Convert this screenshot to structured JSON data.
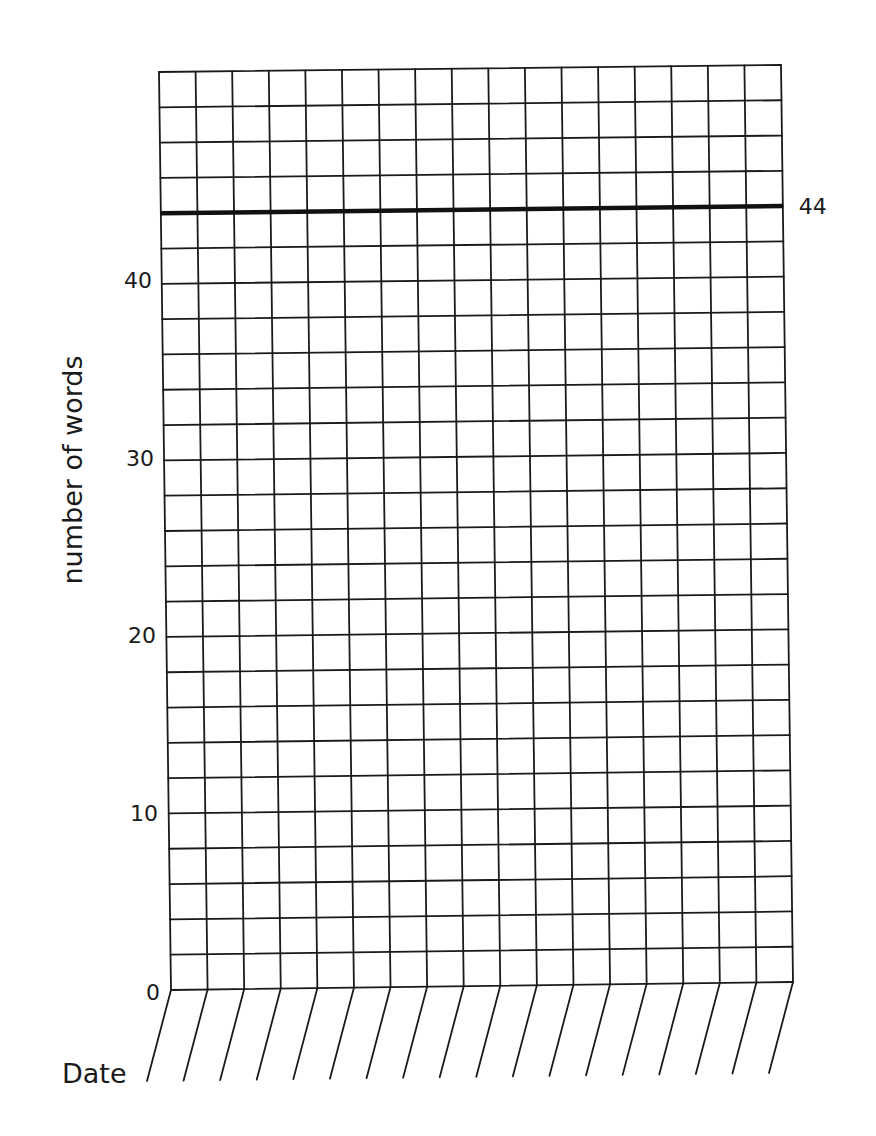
{
  "chart_data": {
    "type": "line",
    "title": "",
    "xlabel": "Date",
    "ylabel": "number of words",
    "ylim": [
      0,
      52
    ],
    "y_step_per_row": 2,
    "yticks": [
      0,
      10,
      20,
      30,
      40
    ],
    "ytick_labels": [
      "0",
      "10",
      "20",
      "30",
      "40"
    ],
    "date_columns": 17,
    "date_values": [
      "",
      "",
      "",
      "",
      "",
      "",
      "",
      "",
      "",
      "",
      "",
      "",
      "",
      "",
      "",
      "",
      ""
    ],
    "series": [],
    "reference_lines": [
      {
        "name": "goal",
        "y": 44,
        "label": "44",
        "color": "#111111"
      }
    ],
    "grid": true,
    "legend": null
  },
  "labels": {
    "y_axis_title": "number of words",
    "x_axis_title": "Date",
    "goal_label": "44",
    "tick_0": "0",
    "tick_10": "10",
    "tick_20": "20",
    "tick_30": "30",
    "tick_40": "40"
  },
  "colors": {
    "grid": "#1a1a1a",
    "background": "#ffffff"
  }
}
